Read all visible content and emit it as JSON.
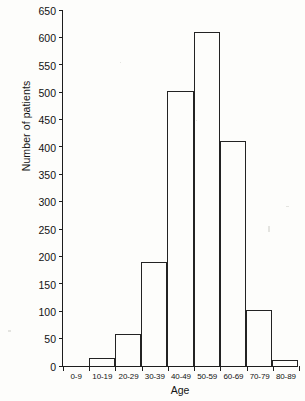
{
  "figure": {
    "background": "#fdfdfb",
    "ink_color": "#232323"
  },
  "axes": {
    "y_title": "Number of patients",
    "x_title": "Age",
    "y_ticks": [
      "0",
      "50",
      "100",
      "150",
      "200",
      "250",
      "300",
      "350",
      "400",
      "450",
      "500",
      "550",
      "600",
      "650"
    ]
  },
  "chart_data": {
    "type": "bar",
    "title": "",
    "subtitle": "",
    "xlabel": "Age",
    "ylabel": "Number of patients",
    "categories": [
      "0-9",
      "10-19",
      "20-29",
      "30-39",
      "40-49",
      "50-59",
      "60-69",
      "70-79",
      "80-89"
    ],
    "values": [
      0,
      14,
      59,
      190,
      503,
      610,
      410,
      102,
      11
    ],
    "ylim": [
      0,
      650
    ],
    "y_tick_step": 50,
    "y_tick_values": [
      0,
      50,
      100,
      150,
      200,
      250,
      300,
      350,
      400,
      450,
      500,
      550,
      600,
      650
    ],
    "grid": false,
    "legend": null,
    "legend_position": "none",
    "bar_style": "outline-only (unfilled), adjacent bars (histogram)"
  }
}
